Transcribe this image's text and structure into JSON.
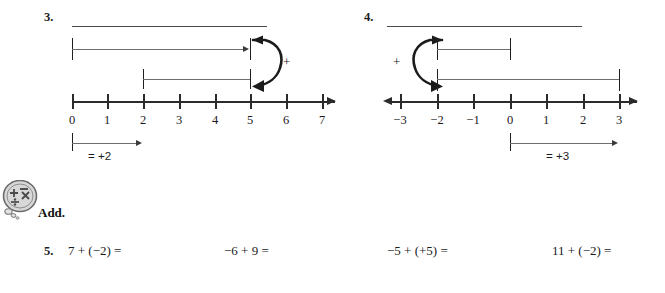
{
  "worksheet": {
    "problems": [
      {
        "number": "3.",
        "answer_blank": "",
        "number_line": {
          "labels": [
            "0",
            "1",
            "2",
            "3",
            "4",
            "5",
            "6",
            "7"
          ],
          "left_arrow": false,
          "right_arrow": true
        },
        "operator": "+",
        "bars": [
          {
            "from": "0",
            "to": "5"
          },
          {
            "from": "2",
            "to": "5"
          }
        ],
        "legend": {
          "text": "= +2",
          "from": "0",
          "to": "2"
        }
      },
      {
        "number": "4.",
        "answer_blank": "",
        "number_line": {
          "labels": [
            "−3",
            "−2",
            "−1",
            "0",
            "1",
            "2",
            "3"
          ],
          "left_arrow": true,
          "right_arrow": true
        },
        "operator": "+",
        "bars": [
          {
            "from": "−2",
            "to": "1"
          },
          {
            "from": "−2",
            "to": "3"
          }
        ],
        "legend": {
          "text": "= +3",
          "from": "0",
          "to": "3"
        }
      }
    ],
    "section": {
      "icon_name": "math-operations-badge-icon",
      "title": "Add.",
      "exercise_number": "5.",
      "expressions": [
        "7 + (−2) =",
        "−6 + 9 =",
        "−5 + (+5) =",
        "11 + (−2) ="
      ]
    },
    "colors": {
      "ink": "#1b1b1b",
      "axis": "#2b2b2b",
      "rule": "#4a4a4a",
      "bar": "#6e6e6e",
      "icon_fill": "#d8d8d8"
    }
  }
}
